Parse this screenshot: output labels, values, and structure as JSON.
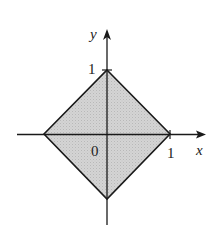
{
  "figure": {
    "type": "coordinate-plot",
    "shape": "square-rotated-45 (diamond) |x|+|y|<=1, shaded",
    "colors": {
      "fill": "#cfcfcf",
      "stroke": "#1a1a1a",
      "background": "#ffffff"
    },
    "axes": {
      "x_label": "x",
      "y_label": "y",
      "origin_label": "0",
      "x_tick_label": "1",
      "y_tick_label": "1"
    },
    "vertices": [
      {
        "name": "top",
        "x": 0,
        "y": 1
      },
      {
        "name": "right",
        "x": 1,
        "y": 0
      },
      {
        "name": "bottom",
        "x": 0,
        "y": -1
      },
      {
        "name": "left",
        "x": -1,
        "y": 0
      }
    ]
  }
}
